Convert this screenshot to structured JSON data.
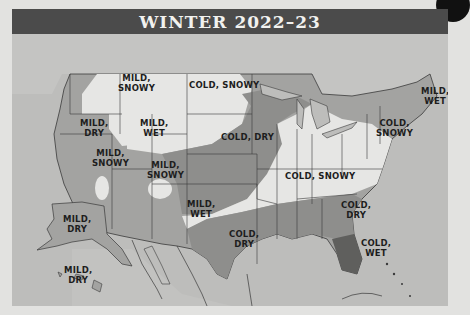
{
  "title": "WINTER 2022–23",
  "colors": {
    "title_bar": "#4b4b4b",
    "water_background": "#bdbdbb",
    "mild_region": "#a3a3a1",
    "dry_region": "#8e8e8c",
    "snowy_region": "#e6e6e4",
    "wet_region": "#5f5f5d",
    "border_lines": "#3a3a3a"
  },
  "regions": [
    {
      "id": "pacific-northwest-interior",
      "line1": "MILD,",
      "line2": "SNOWY"
    },
    {
      "id": "northern-plains",
      "line1": "COLD, SNOWY",
      "line2": ""
    },
    {
      "id": "west-coast",
      "line1": "MILD,",
      "line2": "DRY"
    },
    {
      "id": "intermountain-north",
      "line1": "MILD,",
      "line2": "WET"
    },
    {
      "id": "central-plains",
      "line1": "COLD, DRY",
      "line2": ""
    },
    {
      "id": "california-sierra",
      "line1": "MILD,",
      "line2": "SNOWY"
    },
    {
      "id": "four-corners",
      "line1": "MILD,",
      "line2": "SNOWY"
    },
    {
      "id": "new-mexico",
      "line1": "MILD,",
      "line2": "WET"
    },
    {
      "id": "great-lakes-ohio-valley",
      "line1": "COLD, SNOWY",
      "line2": ""
    },
    {
      "id": "northeast-interior",
      "line1": "COLD,",
      "line2": "SNOWY"
    },
    {
      "id": "new-england-coast",
      "line1": "MILD,",
      "line2": "WET"
    },
    {
      "id": "southeast",
      "line1": "COLD,",
      "line2": "DRY"
    },
    {
      "id": "texas",
      "line1": "COLD,",
      "line2": "DRY"
    },
    {
      "id": "florida",
      "line1": "COLD,",
      "line2": "WET"
    },
    {
      "id": "alaska",
      "line1": "MILD,",
      "line2": "DRY"
    },
    {
      "id": "hawaii",
      "line1": "MILD,",
      "line2": "DRY"
    }
  ]
}
